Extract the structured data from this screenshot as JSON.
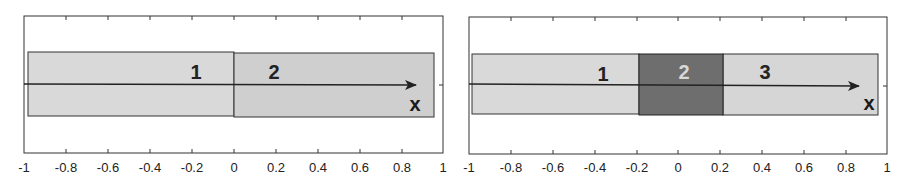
{
  "panels": [
    {
      "name": "two-region-partition",
      "xlim": [
        -1,
        1
      ],
      "tick_labels": [
        "-1",
        "-0.8",
        "-0.6",
        "-0.4",
        "-0.2",
        "0",
        "0.2",
        "0.4",
        "0.6",
        "0.8",
        "1"
      ],
      "axis_variable": "x",
      "regions": [
        {
          "label": "1",
          "x_start": -0.98,
          "x_end": 0.0,
          "fill": "#d9d9d9",
          "text_color": "#222222"
        },
        {
          "label": "2",
          "x_start": 0.0,
          "x_end": 0.95,
          "fill": "#cfcfcf",
          "text_color": "#222222"
        }
      ]
    },
    {
      "name": "three-region-partition",
      "xlim": [
        -1,
        1
      ],
      "tick_labels": [
        "-1",
        "-0.8",
        "-0.6",
        "-0.4",
        "-0.2",
        "0",
        "0.2",
        "0.4",
        "0.6",
        "0.8",
        "1"
      ],
      "axis_variable": "x",
      "regions": [
        {
          "label": "1",
          "x_start": -0.98,
          "x_end": -0.2,
          "fill": "#d9d9d9",
          "text_color": "#222222"
        },
        {
          "label": "2",
          "x_start": -0.2,
          "x_end": 0.2,
          "fill": "#6e6e6e",
          "text_color": "#d8d8d8"
        },
        {
          "label": "3",
          "x_start": 0.2,
          "x_end": 0.95,
          "fill": "#d6d6d6",
          "text_color": "#222222"
        }
      ]
    }
  ],
  "colors": {
    "frame": "#333333",
    "arrow": "#222222",
    "background": "#ffffff"
  }
}
